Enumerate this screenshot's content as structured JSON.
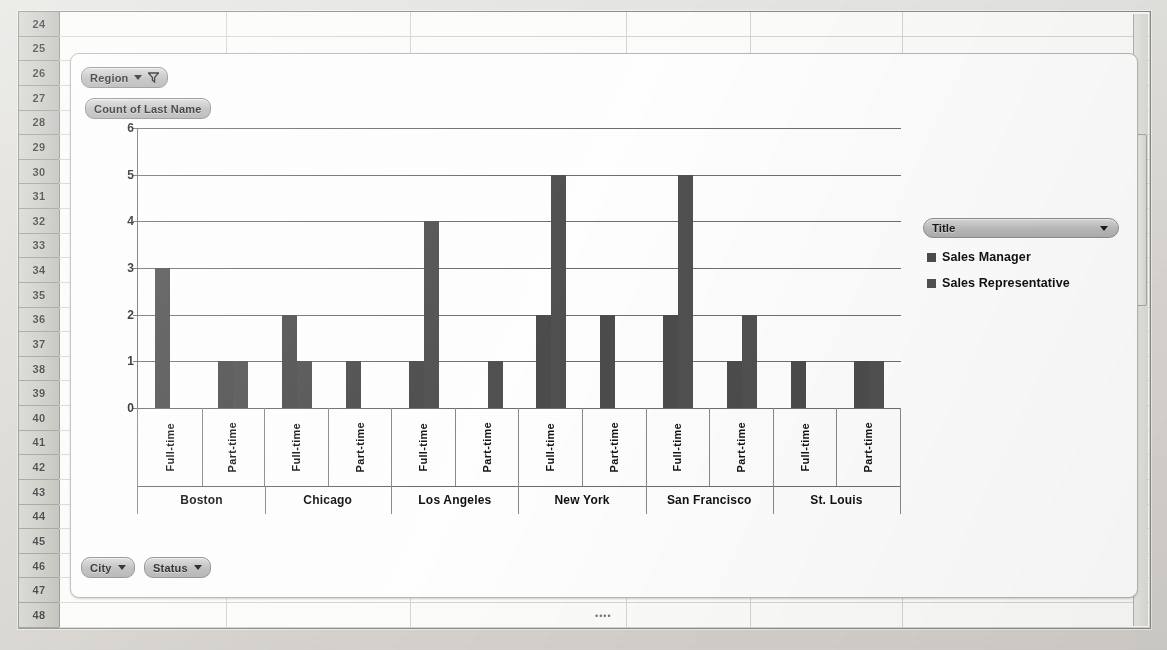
{
  "app": {
    "type": "spreadsheet-pivotchart",
    "row_headers": [
      "24",
      "25",
      "26",
      "27",
      "28",
      "29",
      "30",
      "31",
      "32",
      "33",
      "34",
      "35",
      "36",
      "37",
      "38",
      "39",
      "40",
      "41",
      "42",
      "43",
      "44",
      "45",
      "46",
      "47",
      "48"
    ]
  },
  "pivot_buttons": {
    "region": {
      "label": "Region",
      "icons": [
        "chevron-down-icon",
        "filter-funnel-icon"
      ]
    },
    "value_field": {
      "label": "Count of Last Name"
    },
    "city": {
      "label": "City",
      "icons": [
        "chevron-down-icon"
      ]
    },
    "status": {
      "label": "Status",
      "icons": [
        "chevron-down-icon"
      ]
    }
  },
  "legend": {
    "button_label": "Title",
    "entries": [
      "Sales Manager",
      "Sales Representative"
    ],
    "colors": [
      "#4d4d4d",
      "#515151"
    ]
  },
  "chart_data": {
    "type": "bar",
    "title": "Count of Last Name",
    "xlabel": "",
    "ylabel": "",
    "ylim": [
      0,
      6
    ],
    "yticks": [
      "0",
      "1",
      "2",
      "3",
      "4",
      "5",
      "6"
    ],
    "grid": true,
    "legend_position": "right",
    "groups": [
      "Boston",
      "Chicago",
      "Los Angeles",
      "New York",
      "San Francisco",
      "St. Louis"
    ],
    "subcategories": [
      "Full-time",
      "Part-time"
    ],
    "categories": [
      "Boston Full-time",
      "Boston Part-time",
      "Chicago Full-time",
      "Chicago Part-time",
      "Los Angeles Full-time",
      "Los Angeles Part-time",
      "New York Full-time",
      "New York Part-time",
      "San Francisco Full-time",
      "San Francisco Part-time",
      "St. Louis Full-time",
      "St. Louis Part-time"
    ],
    "series": [
      {
        "name": "Sales Manager",
        "color": "#4d4d4d",
        "values": [
          3,
          1,
          2,
          1,
          1,
          0,
          2,
          2,
          2,
          1,
          1,
          1
        ]
      },
      {
        "name": "Sales Representative",
        "color": "#515151",
        "values": [
          0,
          1,
          1,
          0,
          4,
          1,
          5,
          0,
          5,
          2,
          0,
          1
        ]
      }
    ]
  }
}
